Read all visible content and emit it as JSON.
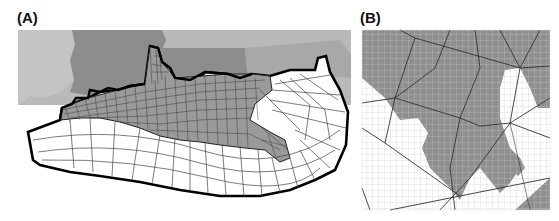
{
  "figure": {
    "panels": [
      {
        "id": "A",
        "label": "(A)",
        "description": "Unstructured finite-element mesh covering coastal Louisiana and the northern Gulf of Mexico shelf; land in gray, mesh domain outlined with thick black boundary"
      },
      {
        "id": "B",
        "label": "(B)",
        "description": "Zoomed detail showing coarse triangular mesh edges overlaid on a fine rectilinear grid with gray land mask"
      }
    ]
  },
  "colors": {
    "background": "#ffffff",
    "land_light": "#bdbdbd",
    "land_dark": "#8f8f8f",
    "land_mid": "#a6a6a6",
    "mesh_line": "#333333",
    "boundary": "#000000",
    "grid_line": "#c8c8c8"
  }
}
